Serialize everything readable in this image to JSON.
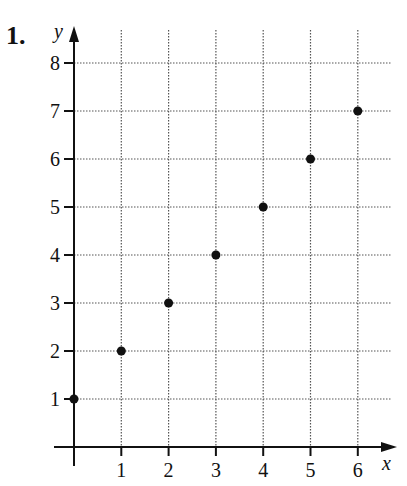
{
  "problem_number": "1.",
  "chart_data": {
    "type": "scatter",
    "title": "",
    "xlabel": "x",
    "ylabel": "y",
    "x": [
      0,
      1,
      2,
      3,
      4,
      5,
      6
    ],
    "y": [
      1,
      2,
      3,
      4,
      5,
      6,
      7
    ],
    "x_ticks": [
      1,
      2,
      3,
      4,
      5,
      6
    ],
    "y_ticks": [
      1,
      2,
      3,
      4,
      5,
      6,
      7,
      8
    ],
    "xlim": [
      0,
      6.5
    ],
    "ylim": [
      0,
      8.5
    ],
    "grid": true,
    "grid_style": "dotted",
    "legend": null
  }
}
